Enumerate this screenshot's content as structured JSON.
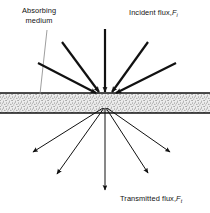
{
  "figure": {
    "width": 210,
    "height": 213,
    "background": "#ffffff",
    "ink_color": "#111111",
    "leader_color": "#888888",
    "medium_fill": "#e8e8e8",
    "stipple_color": "#2b2b2b"
  },
  "labels": {
    "absorbing_line1": "Absorbing",
    "absorbing_line2": "medium",
    "incident_text": "Incident flux,",
    "incident_symbol": "F",
    "incident_subscript": "i",
    "transmitted_text": "Transmitted flux,",
    "transmitted_symbol": "F",
    "transmitted_subscript": "t"
  },
  "medium_layer": {
    "name": "absorbing-medium-band",
    "x": 0,
    "y": 93,
    "width": 210,
    "height": 20,
    "top_rule_y": 93,
    "bottom_rule_y": 113
  },
  "interaction_point": {
    "surface_x": 105,
    "surface_y": 95,
    "scatter_x": 105,
    "scatter_y": 105
  },
  "leader_line": {
    "x1": 47,
    "y1": 30,
    "x2": 40,
    "y2": 94
  },
  "incident_rays": [
    {
      "id": "incident-ray-1",
      "x1": 38,
      "y1": 63,
      "x2": 96,
      "y2": 93
    },
    {
      "id": "incident-ray-2",
      "x1": 62,
      "y1": 42,
      "x2": 99,
      "y2": 92
    },
    {
      "id": "incident-ray-3",
      "x1": 105,
      "y1": 29,
      "x2": 105,
      "y2": 92
    },
    {
      "id": "incident-ray-4",
      "x1": 148,
      "y1": 42,
      "x2": 112,
      "y2": 92
    },
    {
      "id": "incident-ray-5",
      "x1": 176,
      "y1": 63,
      "x2": 116,
      "y2": 93
    }
  ],
  "transmitted_rays": [
    {
      "id": "transmitted-ray-1",
      "x1": 103,
      "y1": 108,
      "x2": 33,
      "y2": 152
    },
    {
      "id": "transmitted-ray-2",
      "x1": 104,
      "y1": 108,
      "x2": 57,
      "y2": 174
    },
    {
      "id": "transmitted-ray-3",
      "x1": 105,
      "y1": 108,
      "x2": 105,
      "y2": 190
    },
    {
      "id": "transmitted-ray-4",
      "x1": 106,
      "y1": 108,
      "x2": 148,
      "y2": 173
    },
    {
      "id": "transmitted-ray-5",
      "x1": 107,
      "y1": 108,
      "x2": 170,
      "y2": 152
    }
  ]
}
